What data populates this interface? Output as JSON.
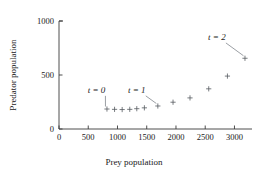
{
  "chart_data": {
    "type": "scatter",
    "title": "",
    "xlabel": "Prey population",
    "ylabel": "Predator population",
    "xlim": [
      0,
      3300
    ],
    "ylim": [
      0,
      1000
    ],
    "xticks": [
      0,
      500,
      1000,
      1500,
      2000,
      2500,
      3000
    ],
    "xtick_labels": [
      "0",
      "500",
      "1000",
      "1500",
      "2000",
      "2500",
      "3000"
    ],
    "yticks": [
      0,
      500,
      1000
    ],
    "ytick_labels": [
      "0",
      "500",
      "1000"
    ],
    "grid": false,
    "legend": "none",
    "marker": "plus",
    "marker_color": "#555a60",
    "axis_color": "#3a3a3a",
    "series": [
      {
        "name": "predator-prey trajectory",
        "x": [
          820,
          950,
          1080,
          1210,
          1330,
          1460,
          1690,
          1950,
          2240,
          2560,
          2880,
          3180
        ],
        "y": [
          185,
          182,
          180,
          182,
          188,
          196,
          213,
          248,
          288,
          372,
          490,
          655
        ]
      }
    ],
    "annotations": [
      {
        "label": "t = 0",
        "label_x": 640,
        "label_y": 330,
        "point_x": 820,
        "point_y": 185
      },
      {
        "label": "t = 1",
        "label_x": 1330,
        "label_y": 330,
        "point_x": 1690,
        "point_y": 213
      },
      {
        "label": "t = 2",
        "label_x": 2700,
        "label_y": 820,
        "point_x": 3180,
        "point_y": 655
      }
    ]
  }
}
